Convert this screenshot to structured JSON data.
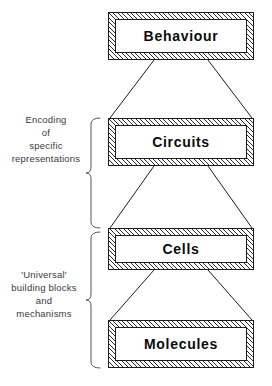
{
  "diagram": {
    "stroke_color": "#1c1c1c",
    "hatch_color": "#2b2b2b",
    "text_color": "#0b0b0b",
    "label_color": "#3a3a3a",
    "background": "#ffffff",
    "levels": [
      {
        "id": "behaviour",
        "label": "Behaviour",
        "x": 108,
        "y": 12,
        "w": 146,
        "h": 48
      },
      {
        "id": "circuits",
        "label": "Circuits",
        "x": 108,
        "y": 118,
        "w": 146,
        "h": 48
      },
      {
        "id": "cells",
        "label": "Cells",
        "x": 108,
        "y": 228,
        "w": 146,
        "h": 42
      },
      {
        "id": "molecules",
        "label": "Molecules",
        "x": 108,
        "y": 320,
        "w": 146,
        "h": 48
      }
    ],
    "connectors": [
      {
        "id": "behaviour-circuits",
        "from": "behaviour",
        "to": "circuits",
        "top_left": 154,
        "top_right": 208,
        "top_y": 60,
        "bottom_left": 110,
        "bottom_right": 252,
        "bottom_y": 118
      },
      {
        "id": "circuits-cells",
        "from": "circuits",
        "to": "cells",
        "top_left": 154,
        "top_right": 208,
        "top_y": 166,
        "bottom_left": 110,
        "bottom_right": 252,
        "bottom_y": 228
      },
      {
        "id": "cells-molecules",
        "from": "cells",
        "to": "molecules",
        "top_left": 154,
        "top_right": 208,
        "top_y": 270,
        "bottom_left": 110,
        "bottom_right": 252,
        "bottom_y": 320
      }
    ],
    "groups": [
      {
        "id": "encoding",
        "lines": [
          "Encoding",
          "of",
          "specific",
          "representations"
        ],
        "brace_top": 118,
        "brace_bottom": 228,
        "label_x": 6,
        "label_y": 113,
        "label_w": 80
      },
      {
        "id": "universal",
        "lines": [
          "'Universal'",
          "building blocks",
          "and",
          "mechanisms"
        ],
        "brace_top": 232,
        "brace_bottom": 368,
        "label_x": 2,
        "label_y": 268,
        "label_w": 84
      }
    ]
  }
}
